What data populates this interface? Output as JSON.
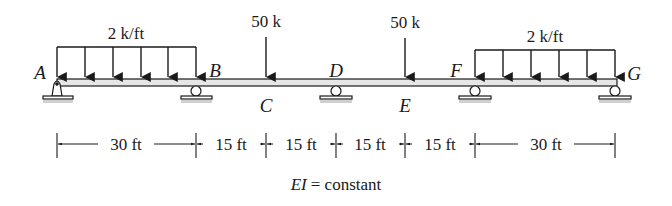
{
  "diagram": {
    "type": "continuous-beam",
    "points": [
      {
        "label": "A",
        "x_ft": 0,
        "support": "pin"
      },
      {
        "label": "B",
        "x_ft": 30,
        "support": "roller"
      },
      {
        "label": "C",
        "x_ft": 45,
        "support": "none"
      },
      {
        "label": "D",
        "x_ft": 60,
        "support": "roller"
      },
      {
        "label": "E",
        "x_ft": 75,
        "support": "none"
      },
      {
        "label": "F",
        "x_ft": 90,
        "support": "roller"
      },
      {
        "label": "G",
        "x_ft": 120,
        "support": "roller"
      }
    ],
    "loads": {
      "udl_left": {
        "label": "2 k/ft",
        "from": "A",
        "to": "B"
      },
      "point_c": {
        "label": "50 k",
        "at": "C"
      },
      "point_e": {
        "label": "50 k",
        "at": "E"
      },
      "udl_right": {
        "label": "2 k/ft",
        "from": "F",
        "to": "G"
      }
    },
    "dimensions": [
      {
        "label": "30 ft",
        "from": "A",
        "to": "B"
      },
      {
        "label": "15 ft",
        "from": "B",
        "to": "C"
      },
      {
        "label": "15 ft",
        "from": "C",
        "to": "D"
      },
      {
        "label": "15 ft",
        "from": "D",
        "to": "E"
      },
      {
        "label": "15 ft",
        "from": "E",
        "to": "F"
      },
      {
        "label": "30 ft",
        "from": "F",
        "to": "G"
      }
    ],
    "note": {
      "lhs": "EI",
      "rhs": "= constant"
    },
    "colors": {
      "ink": "#1a1a1a",
      "beam_fill": "#e6e6e6",
      "ground": "#bdbdbd"
    }
  }
}
